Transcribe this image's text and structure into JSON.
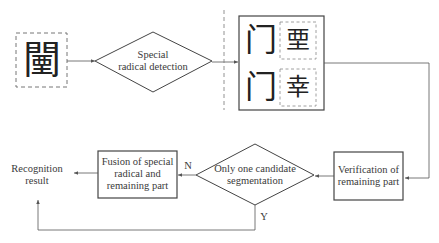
{
  "diagram": {
    "type": "flowchart",
    "nodes": {
      "input_char": {
        "glyph": "闉",
        "shape": "dashed-box"
      },
      "special_radical_detection": {
        "line1": "Special",
        "line2": "radical detection",
        "shape": "diamond"
      },
      "segmentation_candidates": {
        "shape": "box",
        "rows": [
          {
            "radical": "门",
            "remaining": "垔"
          },
          {
            "radical": "门",
            "remaining": "幸"
          }
        ]
      },
      "verification": {
        "line1": "Verification of",
        "line2": "remaining part",
        "shape": "box"
      },
      "only_one_candidate": {
        "line1": "Only one candidate",
        "line2": "segmentation",
        "shape": "diamond"
      },
      "fusion": {
        "line1": "Fusion of special",
        "line2": "radical and",
        "line3": "remaining part",
        "shape": "box"
      },
      "result": {
        "line1": "Recognition",
        "line2": "result",
        "shape": "text"
      }
    },
    "edge_labels": {
      "no": "N",
      "yes": "Y"
    },
    "colors": {
      "stroke": "#555555",
      "dashed": "#777777",
      "background": "#ffffff"
    }
  }
}
